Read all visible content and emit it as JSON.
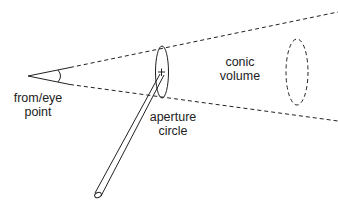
{
  "diagram": {
    "type": "conic viewing volume illustration",
    "labels": {
      "eye_point": {
        "line1": "from/eye",
        "line2": "point"
      },
      "conic_volume": {
        "line1": "conic",
        "line2": "volume"
      },
      "aperture_circle": {
        "line1": "aperture",
        "line2": "circle"
      }
    },
    "colors": {
      "stroke": "#222222",
      "background": "#ffffff"
    }
  }
}
